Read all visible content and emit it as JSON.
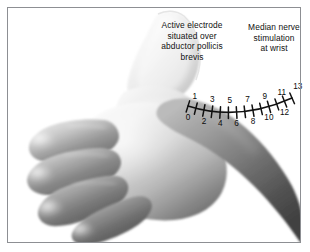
{
  "figure": {
    "background_color": "#ffffff",
    "border_color": "#8d8f93",
    "width": 310,
    "height": 252
  },
  "annotations": {
    "electrode": {
      "text": "Active electrode\nsituated over\nabductor pollicis\nbrevis",
      "lines": [
        "Active electrode",
        "situated over",
        "abductor pollicis",
        "brevis"
      ]
    },
    "median_nerve": {
      "text": "Median nerve\nstimulation\nat wrist",
      "lines": [
        "Median nerve",
        "stimulation",
        "at wrist"
      ]
    }
  },
  "scale": {
    "label": "distance-scale-centimeters",
    "min": 0,
    "max": 13,
    "tick_count": 14,
    "line_color": "#111111",
    "number_color": "#0b0b0b",
    "ticks": [
      {
        "value": "0",
        "x": 188,
        "y": 108,
        "side": "below",
        "label_x": 185,
        "label_y": 118
      },
      {
        "value": "1",
        "x": 196,
        "y": 103,
        "side": "above",
        "label_x": 199,
        "label_y": 96
      },
      {
        "value": "2",
        "x": 203,
        "y": 107,
        "side": "below",
        "label_x": 203,
        "label_y": 120
      },
      {
        "value": "3",
        "x": 211,
        "y": 109,
        "side": "above",
        "label_x": 213,
        "label_y": 102
      },
      {
        "value": "4",
        "x": 219,
        "y": 112,
        "side": "below",
        "label_x": 219,
        "label_y": 124
      },
      {
        "value": "5",
        "x": 227,
        "y": 111,
        "side": "above",
        "label_x": 228,
        "label_y": 102
      },
      {
        "value": "6",
        "x": 235,
        "y": 113,
        "side": "below",
        "label_x": 235,
        "label_y": 124
      },
      {
        "value": "7",
        "x": 243,
        "y": 110,
        "side": "above",
        "label_x": 244,
        "label_y": 101
      },
      {
        "value": "8",
        "x": 251,
        "y": 112,
        "side": "below",
        "label_x": 251,
        "label_y": 123
      },
      {
        "value": "9",
        "x": 259,
        "y": 107,
        "side": "above",
        "label_x": 261,
        "label_y": 99
      },
      {
        "value": "10",
        "x": 267,
        "y": 110,
        "side": "below",
        "label_x": 268,
        "label_y": 121
      },
      {
        "value": "11",
        "x": 275,
        "y": 104,
        "side": "above",
        "label_x": 278,
        "label_y": 96
      },
      {
        "value": "12",
        "x": 283,
        "y": 107,
        "side": "below",
        "label_x": 284,
        "label_y": 118
      },
      {
        "value": "13",
        "x": 292,
        "y": 99,
        "side": "above",
        "label_x": 295,
        "label_y": 92
      }
    ]
  },
  "image_content": {
    "subject": "human-hand",
    "view": "palmar-radial",
    "description": "Grayscale photograph of a left hand with thumb uppermost, four fingers extending to the left, and the wrist and forearm at the lower right.",
    "parts": [
      "thumb",
      "index-finger",
      "middle-finger",
      "ring-finger",
      "little-finger",
      "thenar-eminence",
      "palm",
      "wrist",
      "forearm"
    ]
  }
}
